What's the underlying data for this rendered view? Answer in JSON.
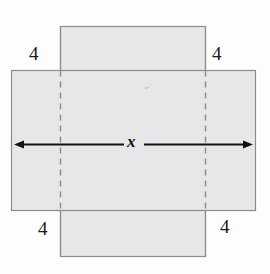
{
  "figure": {
    "canvas": {
      "width": 270,
      "height": 274
    },
    "colors": {
      "fill": "#e6e7e8",
      "stroke": "#8a8c8e",
      "dash": "#8a8c8e",
      "arrow": "#111111",
      "text": "#1a1a1a",
      "background": "#fdfdfd"
    },
    "shapes": {
      "vertical_rect": {
        "x": 60,
        "y": 26,
        "width": 145,
        "height": 230
      },
      "horizontal_rect": {
        "x": 11,
        "y": 70,
        "width": 244,
        "height": 140
      },
      "dashed_lines": [
        {
          "x": 60,
          "y1": 70,
          "y2": 210
        },
        {
          "x": 205,
          "y1": 70,
          "y2": 210
        }
      ]
    },
    "arrow": {
      "y": 144,
      "x1": 14,
      "x2": 253,
      "style": "double-headed",
      "label_gap": {
        "left": 120,
        "right": 146
      }
    },
    "labels": {
      "corner_top_left": "4",
      "corner_top_right": "4",
      "corner_bottom_left": "4",
      "corner_bottom_right": "4",
      "width_variable": "x"
    }
  }
}
